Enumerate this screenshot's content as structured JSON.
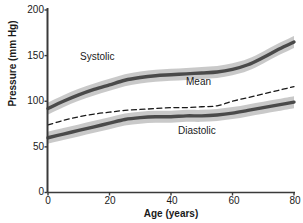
{
  "chart_data": {
    "type": "line",
    "title": "",
    "subtitle": "",
    "xlabel": "Age (years)",
    "ylabel": "Pressure (mm Hg)",
    "xlim": [
      0,
      80
    ],
    "ylim": [
      0,
      200
    ],
    "xticks": [
      0,
      20,
      40,
      60,
      80
    ],
    "yticks": [
      0,
      50,
      100,
      150,
      200
    ],
    "xtick_labels": [
      "0",
      "20",
      "40",
      "60",
      "80"
    ],
    "ytick_labels": [
      "0",
      "50",
      "100",
      "150",
      "200"
    ],
    "grid": false,
    "legend_position": "inline-annotations",
    "x": [
      0,
      5,
      10,
      15,
      20,
      25,
      30,
      35,
      40,
      45,
      50,
      55,
      60,
      65,
      70,
      75,
      80
    ],
    "series": [
      {
        "name": "Systolic",
        "style": "solid-thick-with-band",
        "color": "#4a4a4a",
        "band_color": "#c4c4c4",
        "band_halfwidth": 6,
        "values": [
          92,
          100,
          107,
          113,
          118,
          123,
          126,
          128,
          129,
          130,
          131,
          132,
          135,
          140,
          148,
          157,
          165
        ]
      },
      {
        "name": "Mean",
        "style": "dashed-thin",
        "color": "#1a1a1a",
        "band_halfwidth": 0,
        "values": [
          74,
          79,
          83,
          86,
          88,
          90,
          91,
          92,
          93,
          93,
          94,
          95,
          100,
          104,
          108,
          112,
          116
        ]
      },
      {
        "name": "Diastolic",
        "style": "solid-thick-with-band",
        "color": "#4a4a4a",
        "band_color": "#c4c4c4",
        "band_halfwidth": 6,
        "values": [
          60,
          64,
          68,
          72,
          76,
          80,
          82,
          83,
          83,
          84,
          84,
          85,
          87,
          90,
          93,
          96,
          99
        ]
      }
    ],
    "annotations": [
      {
        "text": "Systolic",
        "x_px": 80,
        "y_px": 52
      },
      {
        "text": "Mean",
        "x_px": 186,
        "y_px": 77
      },
      {
        "text": "Diastolic",
        "x_px": 178,
        "y_px": 126
      }
    ]
  },
  "axes": {
    "y_title": "Pressure (mm Hg)",
    "x_title": "Age (years)",
    "y_labels": [
      "200",
      "150",
      "100",
      "50",
      "0"
    ],
    "x_labels": [
      "0",
      "20",
      "40",
      "60",
      "80"
    ]
  },
  "labels": {
    "systolic": "Systolic",
    "mean": "Mean",
    "diastolic": "Diastolic"
  },
  "colors": {
    "line": "#4a4a4a",
    "band": "#c4c4c4",
    "dashed": "#1a1a1a",
    "axis": "#3a3a3a",
    "background": "#ffffff"
  }
}
